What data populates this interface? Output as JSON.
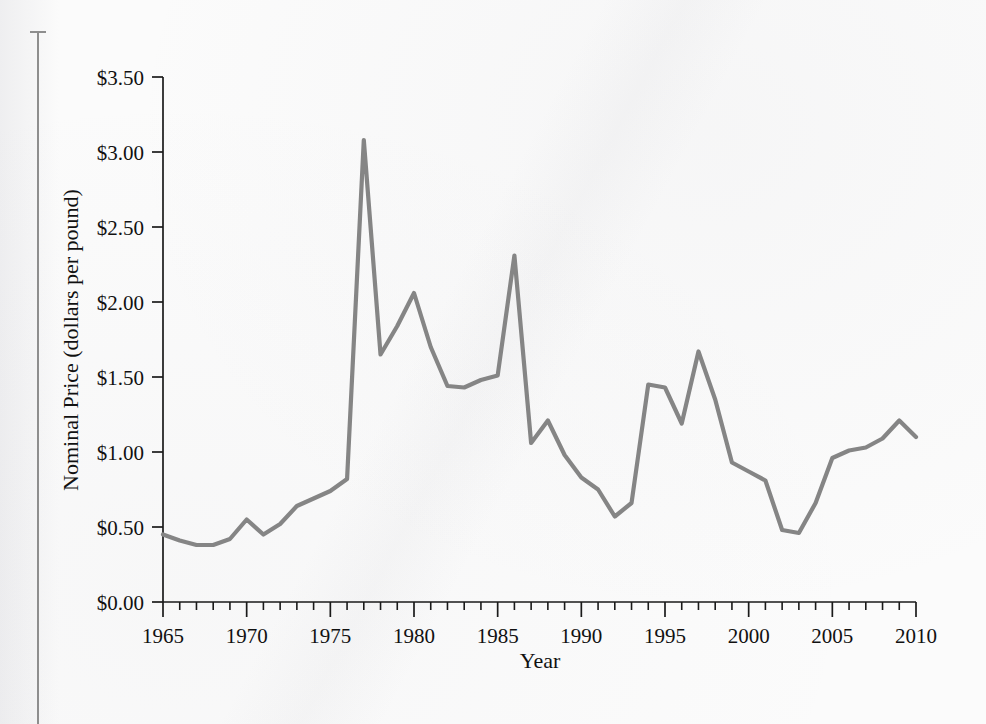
{
  "figure": {
    "background_color": "#fbfbfb",
    "line_color": "#858585",
    "axis_color": "#1a1a1a",
    "gutter_line_color": "#8e8e8e"
  },
  "chart_data": {
    "type": "line",
    "title": "",
    "xlabel": "Year",
    "ylabel": "Nominal Price (dollars per pound)",
    "xlim": [
      1965,
      2010
    ],
    "ylim": [
      0.0,
      3.5
    ],
    "grid": false,
    "legend": null,
    "x_tick_labels": [
      "1965",
      "1970",
      "1975",
      "1980",
      "1985",
      "1990",
      "1995",
      "2000",
      "2005",
      "2010"
    ],
    "x_ticks": [
      1965,
      1970,
      1975,
      1980,
      1985,
      1990,
      1995,
      2000,
      2005,
      2010
    ],
    "x_minor_tick_interval": 1,
    "y_tick_labels": [
      "$0.00",
      "$0.50",
      "$1.00",
      "$1.50",
      "$2.00",
      "$2.50",
      "$3.00",
      "$3.50"
    ],
    "y_ticks": [
      0.0,
      0.5,
      1.0,
      1.5,
      2.0,
      2.5,
      3.0,
      3.5
    ],
    "series": [
      {
        "name": "Nominal Price",
        "color": "#858585",
        "x": [
          1965,
          1966,
          1967,
          1968,
          1969,
          1970,
          1971,
          1972,
          1973,
          1974,
          1975,
          1976,
          1977,
          1978,
          1979,
          1980,
          1981,
          1982,
          1983,
          1984,
          1985,
          1986,
          1987,
          1988,
          1989,
          1990,
          1991,
          1992,
          1993,
          1994,
          1995,
          1996,
          1997,
          1998,
          1999,
          2000,
          2001,
          2002,
          2003,
          2004,
          2005,
          2006,
          2007,
          2008,
          2009,
          2010
        ],
        "values": [
          0.45,
          0.41,
          0.38,
          0.38,
          0.42,
          0.55,
          0.45,
          0.52,
          0.64,
          0.69,
          0.74,
          0.82,
          3.08,
          1.65,
          1.84,
          2.06,
          1.7,
          1.44,
          1.43,
          1.48,
          1.51,
          2.31,
          1.06,
          1.21,
          0.98,
          0.83,
          0.75,
          0.57,
          0.66,
          1.45,
          1.43,
          1.19,
          1.67,
          1.35,
          0.93,
          0.87,
          0.81,
          0.48,
          0.46,
          0.66,
          0.96,
          1.01,
          1.03,
          1.09,
          1.21,
          1.1
        ]
      }
    ]
  }
}
